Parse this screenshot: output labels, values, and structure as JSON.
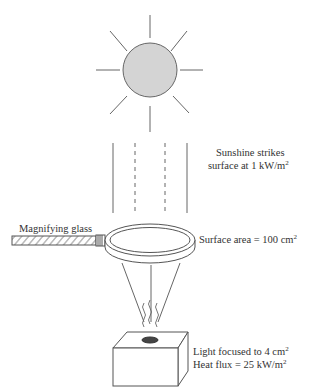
{
  "diagram": {
    "colors": {
      "line": "#555555",
      "sun_fill": "#d4d4d4",
      "spot_fill": "#444444",
      "text": "#333333"
    },
    "labels": {
      "sunshine_line1": "Sunshine strikes",
      "sunshine_line2_prefix": "surface at 1 kW/m",
      "sunshine_line2_sup": "2",
      "magnifying_glass": "Magnifying glass",
      "surface_area_prefix": "Surface area = 100 cm",
      "surface_area_sup": "2",
      "focused_prefix": "Light focused to 4 cm",
      "focused_sup": "2",
      "heat_flux_prefix": "Heat flux = 25 kW/m",
      "heat_flux_sup": "2"
    }
  }
}
